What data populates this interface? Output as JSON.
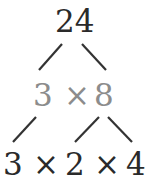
{
  "diagram": {
    "type": "factor-tree",
    "root": "24",
    "level1": {
      "left": "3",
      "op": "×",
      "right": "8"
    },
    "level2": {
      "a": "3",
      "op1": "×",
      "b": "2",
      "op2": "×",
      "c": "4"
    },
    "colors": {
      "primary": "#2a2a2a",
      "intermediate": "#8c8c8c"
    }
  }
}
